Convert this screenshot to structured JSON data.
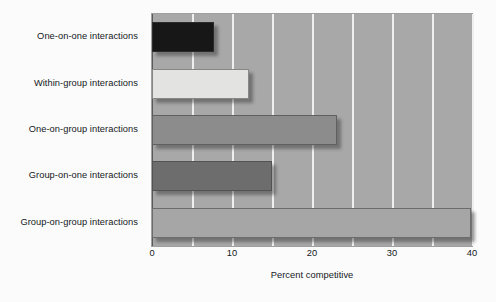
{
  "chart_data": {
    "type": "bar",
    "orientation": "horizontal",
    "title": "",
    "xlabel": "Percent competitive",
    "ylabel": "",
    "categories": [
      "One-on-one interactions",
      "Within-group interactions",
      "One-on-group interactions",
      "Group-on-one interactions",
      "Group-on-group interactions"
    ],
    "values": [
      7.8,
      12.1,
      23.1,
      15.0,
      39.9
    ],
    "bar_colors": [
      "#171717",
      "#e3e3e1",
      "#8c8c8c",
      "#6d6d6d",
      "#a6a6a6"
    ],
    "xlim": [
      0,
      40
    ],
    "xticks": [
      0,
      10,
      20,
      30,
      40
    ],
    "xtick_labels": [
      "0",
      "10",
      "20",
      "30",
      "40"
    ],
    "gridlines_at": [
      0,
      5,
      10,
      15,
      20,
      25,
      30,
      35,
      40
    ],
    "grid": true,
    "grid_color": "#efefef",
    "plot_background": "#a8a8a8",
    "figure_background": "#fbfbfb",
    "legend": null,
    "legend_position": "none"
  }
}
